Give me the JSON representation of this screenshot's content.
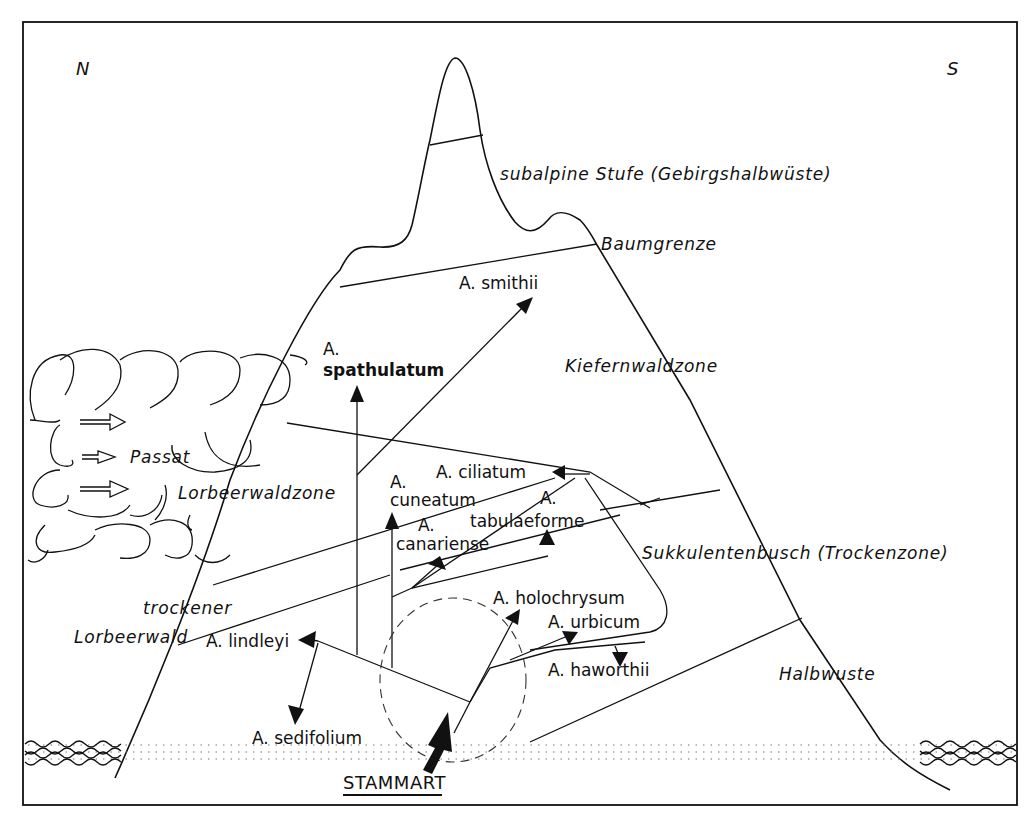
{
  "figure": {
    "compass": {
      "north": "N",
      "south": "S"
    },
    "zones": {
      "subalpine": "subalpine Stufe  (Gebirgshalbwüste)",
      "treeline": "Baumgrenze",
      "pine_forest": "Kiefernwaldzone",
      "laurel_forest": "Lorbeerwaldzone",
      "dry_laurel_line1": "trockener",
      "dry_laurel_line2": "Lorbeerwald",
      "succulent_bush": "Sukkulentenbusch (Trockenzone)",
      "semi_desert": "Halbwuste"
    },
    "wind": {
      "label": "Passat"
    },
    "species": {
      "smithii": "A. smithii",
      "spathulatum_prefix": "A.",
      "spathulatum": "spathulatum",
      "ciliatum": "A. ciliatum",
      "cuneatum_prefix": "A.",
      "cuneatum": "cuneatum",
      "tabulaeforme_prefix": "A.",
      "tabulaeforme": "tabulaeforme",
      "canariense_prefix": "A.",
      "canariense": "canariense",
      "holochrysum": "A. holochrysum",
      "urbicum": "A. urbicum",
      "haworthii": "A. haworthii",
      "lindleyi": "A. lindleyi",
      "sedifolium": "A. sedifolium"
    },
    "origin": {
      "label": "STAMMART"
    }
  }
}
